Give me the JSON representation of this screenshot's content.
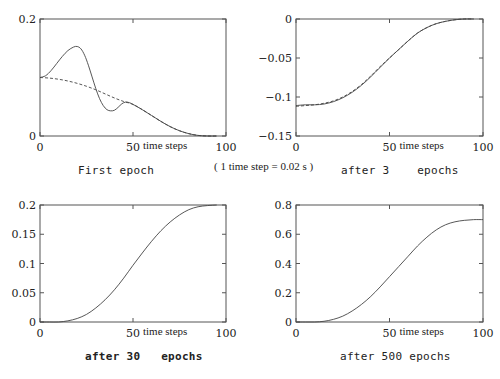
{
  "annotation": "( 1 time step = 0.02 s )",
  "chart_data": [
    {
      "type": "line",
      "title": "First epoch",
      "caption_bold": false,
      "xlabel": "time steps",
      "ylabel": "",
      "xlim": [
        0,
        100
      ],
      "ylim": [
        0,
        0.2
      ],
      "xticks": [
        "0",
        "50",
        "100"
      ],
      "yticks": [
        "0",
        "0.2"
      ],
      "ytick_values": [
        0,
        0.2
      ],
      "grid": false,
      "series": [
        {
          "name": "output",
          "style": "solid",
          "x": [
            0,
            3,
            6,
            9,
            12,
            15,
            18,
            20,
            22,
            24,
            26,
            28,
            30,
            32,
            34,
            36,
            38,
            40,
            42,
            44,
            46,
            48,
            50,
            55,
            60,
            65,
            70,
            75,
            80,
            85,
            90,
            95
          ],
          "y": [
            0.1,
            0.103,
            0.112,
            0.124,
            0.136,
            0.146,
            0.152,
            0.153,
            0.149,
            0.138,
            0.121,
            0.101,
            0.081,
            0.064,
            0.052,
            0.045,
            0.043,
            0.044,
            0.049,
            0.055,
            0.058,
            0.057,
            0.054,
            0.045,
            0.035,
            0.025,
            0.016,
            0.009,
            0.004,
            0.001,
            0.0,
            0.0
          ]
        },
        {
          "name": "target",
          "style": "dashed",
          "x": [
            0,
            5,
            10,
            15,
            20,
            25,
            30,
            35,
            40,
            45,
            50,
            55,
            60,
            65,
            70,
            75,
            80,
            85,
            90,
            95
          ],
          "y": [
            0.1,
            0.099,
            0.097,
            0.094,
            0.09,
            0.085,
            0.079,
            0.072,
            0.065,
            0.059,
            0.054,
            0.045,
            0.035,
            0.025,
            0.016,
            0.009,
            0.004,
            0.001,
            0.0,
            0.0
          ]
        }
      ]
    },
    {
      "type": "line",
      "title": "after 3    epochs",
      "caption_bold": false,
      "xlabel": "time steps",
      "ylabel": "",
      "xlim": [
        0,
        100
      ],
      "ylim": [
        -0.15,
        0
      ],
      "xticks": [
        "0",
        "50",
        "100"
      ],
      "yticks": [
        "-0.15",
        "-0.1",
        "-0.05",
        "0"
      ],
      "ytick_values": [
        -0.15,
        -0.1,
        -0.05,
        0
      ],
      "grid": false,
      "series": [
        {
          "name": "output",
          "style": "solid",
          "x": [
            0,
            5,
            10,
            15,
            20,
            25,
            30,
            35,
            40,
            45,
            50,
            55,
            60,
            65,
            70,
            75,
            80,
            85,
            90,
            95
          ],
          "y": [
            -0.111,
            -0.11,
            -0.11,
            -0.109,
            -0.106,
            -0.101,
            -0.094,
            -0.085,
            -0.074,
            -0.062,
            -0.05,
            -0.039,
            -0.028,
            -0.018,
            -0.011,
            -0.006,
            -0.003,
            -0.001,
            0.0,
            0.0
          ]
        },
        {
          "name": "target",
          "style": "dashed",
          "x": [
            0,
            5,
            10,
            15,
            20,
            25,
            30,
            35,
            40,
            45,
            50,
            55,
            60,
            65,
            70,
            75,
            80,
            85,
            90,
            95
          ],
          "y": [
            -0.112,
            -0.111,
            -0.11,
            -0.108,
            -0.105,
            -0.1,
            -0.093,
            -0.084,
            -0.073,
            -0.061,
            -0.05,
            -0.039,
            -0.028,
            -0.018,
            -0.011,
            -0.006,
            -0.003,
            -0.001,
            0.0,
            0.0
          ]
        }
      ]
    },
    {
      "type": "line",
      "title": "after 30   epochs",
      "caption_bold": true,
      "xlabel": "time steps",
      "ylabel": "",
      "xlim": [
        0,
        100
      ],
      "ylim": [
        0,
        0.2
      ],
      "xticks": [
        "0",
        "50",
        "100"
      ],
      "yticks": [
        "0",
        "0.05",
        "0.1",
        "0.15",
        "0.2"
      ],
      "ytick_values": [
        0,
        0.05,
        0.1,
        0.15,
        0.2
      ],
      "grid": false,
      "series": [
        {
          "name": "output",
          "style": "solid",
          "x": [
            0,
            5,
            10,
            15,
            20,
            25,
            30,
            35,
            40,
            45,
            50,
            55,
            60,
            65,
            70,
            75,
            80,
            85,
            90,
            95
          ],
          "y": [
            0.0,
            0.0,
            0.0,
            0.002,
            0.006,
            0.013,
            0.024,
            0.038,
            0.055,
            0.075,
            0.097,
            0.118,
            0.138,
            0.156,
            0.171,
            0.183,
            0.192,
            0.197,
            0.199,
            0.2
          ]
        }
      ]
    },
    {
      "type": "line",
      "title": "after 500 epochs",
      "caption_bold": false,
      "xlabel": "time steps",
      "ylabel": "",
      "xlim": [
        0,
        100
      ],
      "ylim": [
        0,
        0.8
      ],
      "xticks": [
        "0",
        "50",
        "100"
      ],
      "yticks": [
        "0",
        "0.2",
        "0.4",
        "0.6",
        "0.8"
      ],
      "ytick_values": [
        0,
        0.2,
        0.4,
        0.6,
        0.8
      ],
      "grid": false,
      "series": [
        {
          "name": "output",
          "style": "solid",
          "x": [
            0,
            5,
            10,
            15,
            20,
            25,
            30,
            35,
            40,
            45,
            50,
            55,
            60,
            65,
            70,
            75,
            80,
            85,
            90,
            95,
            100
          ],
          "y": [
            0.0,
            0.0,
            0.0,
            0.005,
            0.018,
            0.04,
            0.075,
            0.12,
            0.175,
            0.24,
            0.31,
            0.38,
            0.45,
            0.52,
            0.58,
            0.63,
            0.665,
            0.685,
            0.695,
            0.7,
            0.7
          ]
        }
      ]
    }
  ]
}
